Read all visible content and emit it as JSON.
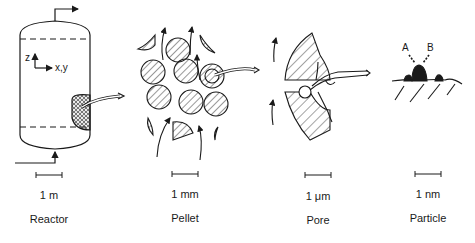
{
  "diagram": {
    "panels": [
      {
        "name": "Reactor",
        "scale": "1 m"
      },
      {
        "name": "Pellet",
        "scale": "1 mm"
      },
      {
        "name": "Pore",
        "scale": "1 μm"
      },
      {
        "name": "Particle",
        "scale": "1 nm"
      }
    ],
    "reactor_axes": {
      "vertical": "z",
      "horizontal": "x,y"
    },
    "particle_species": {
      "a": "A",
      "b": "B"
    },
    "stroke_color": "#1a1a1a",
    "hatch_color": "#333333"
  }
}
